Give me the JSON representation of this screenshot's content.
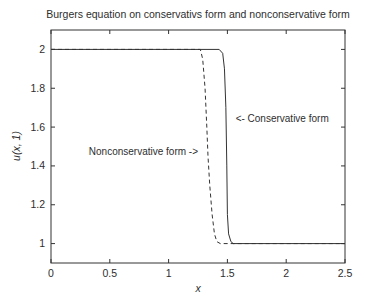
{
  "chart_data": {
    "type": "line",
    "title": "Burgers equation on conservativs form and nonconservative form",
    "xlabel": "x",
    "ylabel": "u(x, 1)",
    "xlim": [
      0,
      2.5
    ],
    "ylim": [
      0.9,
      2.1
    ],
    "xticks": [
      0,
      0.5,
      1,
      1.5,
      2,
      2.5
    ],
    "xtick_labels": [
      "0",
      "0.5",
      "1",
      "1.5",
      "2",
      "2.5"
    ],
    "yticks": [
      1,
      1.2,
      1.4,
      1.6,
      1.8,
      2
    ],
    "ytick_labels": [
      "1",
      "1.2",
      "1.4",
      "1.6",
      "1.8",
      "2"
    ],
    "grid": false,
    "legend": "none",
    "background": "#ffffff",
    "axis_color": "#333333",
    "line_color": "#333333",
    "series": [
      {
        "name": "Nonconservative form",
        "style": "dashed",
        "points": [
          [
            0,
            2
          ],
          [
            1.27,
            2
          ],
          [
            1.29,
            1.95
          ],
          [
            1.31,
            1.8
          ],
          [
            1.325,
            1.6
          ],
          [
            1.335,
            1.45
          ],
          [
            1.35,
            1.3
          ],
          [
            1.37,
            1.15
          ],
          [
            1.39,
            1.05
          ],
          [
            1.41,
            1.01
          ],
          [
            1.44,
            1.0
          ],
          [
            2.5,
            1.0
          ]
        ]
      },
      {
        "name": "Conservative form",
        "style": "solid",
        "points": [
          [
            0,
            2
          ],
          [
            1.43,
            2
          ],
          [
            1.46,
            1.98
          ],
          [
            1.475,
            1.9
          ],
          [
            1.487,
            1.7
          ],
          [
            1.495,
            1.4
          ],
          [
            1.5,
            1.15
          ],
          [
            1.51,
            1.05
          ],
          [
            1.53,
            1.01
          ],
          [
            1.55,
            1.0
          ],
          [
            2.5,
            1.0
          ]
        ]
      }
    ],
    "annotations": [
      {
        "text": "Nonconservative form ->",
        "x": 1.25,
        "y": 1.47,
        "align": "right"
      },
      {
        "text": "<- Conservative form",
        "x": 1.57,
        "y": 1.64,
        "align": "left"
      }
    ]
  }
}
